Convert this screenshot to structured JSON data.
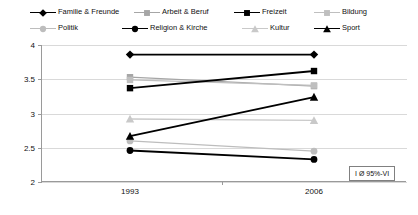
{
  "chart_data": {
    "type": "line",
    "title": "",
    "subtitle": "",
    "xlabel": "",
    "ylabel": "",
    "x": [
      "1993",
      "2006"
    ],
    "categories": [
      "1993",
      "2006"
    ],
    "ylim": [
      2,
      4
    ],
    "yticks": [
      "2",
      "2.5",
      "3",
      "3.5",
      "4"
    ],
    "ytick_values": [
      2,
      2.5,
      3,
      3.5,
      4
    ],
    "grid": true,
    "legend_position": "top",
    "annotation": "I Ø 95%-VI",
    "series": [
      {
        "name": "Familie & Freunde",
        "color": "#000000",
        "marker": "diamond",
        "values": [
          3.86,
          3.86
        ]
      },
      {
        "name": "Arbeit & Beruf",
        "color": "#a6a6a6",
        "marker": "square",
        "values": [
          3.53,
          3.4
        ]
      },
      {
        "name": "Freizeit",
        "color": "#000000",
        "marker": "square",
        "values": [
          3.37,
          3.62
        ]
      },
      {
        "name": "Bildung",
        "color": "#bfbfbf",
        "marker": "square",
        "values": [
          3.49,
          3.41
        ]
      },
      {
        "name": "Politik",
        "color": "#bdbdbd",
        "marker": "circle",
        "values": [
          2.6,
          2.45
        ]
      },
      {
        "name": "Religion & Kirche",
        "color": "#000000",
        "marker": "circle",
        "values": [
          2.46,
          2.33
        ]
      },
      {
        "name": "Kultur",
        "color": "#c9c9c9",
        "marker": "triangle",
        "values": [
          2.92,
          2.9
        ]
      },
      {
        "name": "Sport",
        "color": "#000000",
        "marker": "triangle",
        "values": [
          2.67,
          3.24
        ]
      }
    ]
  },
  "legend": {
    "rows": [
      [
        {
          "label": "Familie & Freunde",
          "series_index": 0
        },
        {
          "label": "Arbeit & Beruf",
          "series_index": 1
        },
        {
          "label": "Freizeit",
          "series_index": 2
        },
        {
          "label": "Bildung",
          "series_index": 3
        }
      ],
      [
        {
          "label": "Politik",
          "series_index": 4
        },
        {
          "label": "Religion & Kirche",
          "series_index": 5
        },
        {
          "label": "Kultur",
          "series_index": 6
        },
        {
          "label": "Sport",
          "series_index": 7
        }
      ]
    ]
  },
  "axes": {
    "y_tick_labels": [
      "4",
      "3.5",
      "3",
      "2.5",
      "2"
    ],
    "x_tick_labels": [
      "1993",
      "2006"
    ]
  },
  "annotation_box": {
    "text": "I Ø 95%-VI"
  },
  "colors": {
    "grid": "#d9d9d9",
    "axis": "#9a9a9a",
    "text": "#111111",
    "background": "#ffffff"
  }
}
